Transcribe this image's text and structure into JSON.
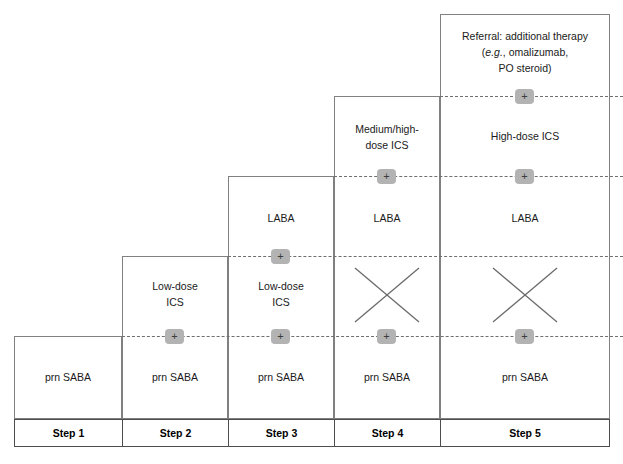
{
  "diagram": {
    "plus_symbol": "+",
    "badge_color": "#b3b3b3",
    "box_border_color": "#808080",
    "dashed_line_color": "#6f6f6f",
    "footer_border_color": "#4d4d4d",
    "text_color": "#1a1a1a"
  },
  "steps": [
    {
      "id": "step-1",
      "label": "Step 1",
      "tiers": [
        {
          "kind": "text",
          "lines": [
            "prn SABA"
          ]
        }
      ]
    },
    {
      "id": "step-2",
      "label": "Step 2",
      "tiers": [
        {
          "kind": "text",
          "lines": [
            "Low-dose",
            "ICS"
          ]
        },
        {
          "kind": "plus"
        },
        {
          "kind": "text",
          "lines": [
            "prn SABA"
          ]
        }
      ]
    },
    {
      "id": "step-3",
      "label": "Step 3",
      "tiers": [
        {
          "kind": "text",
          "lines": [
            "LABA"
          ]
        },
        {
          "kind": "plus"
        },
        {
          "kind": "text",
          "lines": [
            "Low-dose",
            "ICS"
          ]
        },
        {
          "kind": "plus"
        },
        {
          "kind": "text",
          "lines": [
            "prn SABA"
          ]
        }
      ]
    },
    {
      "id": "step-4",
      "label": "Step 4",
      "tiers": [
        {
          "kind": "text",
          "lines": [
            "Medium/high-",
            "dose ICS"
          ]
        },
        {
          "kind": "plus"
        },
        {
          "kind": "text",
          "lines": [
            "LABA"
          ]
        },
        {
          "kind": "cross"
        },
        {
          "kind": "plus"
        },
        {
          "kind": "text",
          "lines": [
            "prn SABA"
          ]
        }
      ]
    },
    {
      "id": "step-5",
      "label": "Step 5",
      "tiers": [
        {
          "kind": "text",
          "lines": [
            "Referral: additional therapy",
            "(e.g., omalizumab,",
            "PO steroid)"
          ],
          "italic_segment": "e.g."
        },
        {
          "kind": "plus"
        },
        {
          "kind": "text",
          "lines": [
            "High-dose ICS"
          ]
        },
        {
          "kind": "plus"
        },
        {
          "kind": "text",
          "lines": [
            "LABA"
          ]
        },
        {
          "kind": "cross"
        },
        {
          "kind": "plus"
        },
        {
          "kind": "text",
          "lines": [
            "prn SABA"
          ]
        }
      ]
    }
  ],
  "cells": {
    "s1_saba": "prn SABA",
    "s2_ics_l1": "Low-dose",
    "s2_ics_l2": "ICS",
    "s2_saba": "prn SABA",
    "s3_laba": "LABA",
    "s3_ics_l1": "Low-dose",
    "s3_ics_l2": "ICS",
    "s3_saba": "prn SABA",
    "s4_ics_l1": "Medium/high-",
    "s4_ics_l2": "dose ICS",
    "s4_laba": "LABA",
    "s4_saba": "prn SABA",
    "s5_ref_l1_a": "Referral: additional therapy",
    "s5_ref_l2_a": "(",
    "s5_ref_l2_em": "e.g.",
    "s5_ref_l2_b": ", omalizumab,",
    "s5_ref_l3": "PO steroid)",
    "s5_ics": "High-dose ICS",
    "s5_laba": "LABA",
    "s5_saba": "prn SABA"
  },
  "footer": {
    "labels": [
      "Step 1",
      "Step 2",
      "Step 3",
      "Step 4",
      "Step 5"
    ]
  },
  "plus_badges": {
    "b1": "+",
    "b2": "+",
    "b3": "+",
    "b4": "+",
    "b5": "+",
    "b6": "+",
    "b7": "+",
    "b8": "+",
    "b9": "+",
    "b10": "+",
    "b11": "+",
    "b12": "+",
    "b13": "+"
  }
}
